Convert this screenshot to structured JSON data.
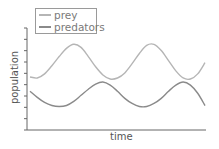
{
  "chart_data": {
    "type": "line",
    "title": "",
    "xlabel": "time",
    "ylabel": "population",
    "x_ticks": [],
    "y_ticks_count": 10,
    "y_tick_labels": [],
    "grid": false,
    "legend_position": "upper-left",
    "x": [
      0,
      1,
      2,
      3,
      4,
      5,
      6,
      7,
      8,
      9,
      10,
      11,
      12,
      13,
      14,
      15,
      16,
      17,
      18,
      19,
      20,
      21,
      22,
      23,
      24
    ],
    "series": [
      {
        "name": "prey",
        "color": "#b5b5b5",
        "values": [
          52,
          51,
          55,
          63,
          72,
          80,
          84,
          81,
          72,
          62,
          54,
          50,
          51,
          56,
          65,
          75,
          83,
          84,
          78,
          68,
          58,
          51,
          50,
          55,
          66
        ]
      },
      {
        "name": "predators",
        "color": "#8a8a8a",
        "values": [
          38,
          32,
          27,
          24,
          23,
          24,
          28,
          34,
          40,
          45,
          47,
          44,
          38,
          31,
          26,
          23,
          23,
          26,
          31,
          38,
          44,
          47,
          44,
          36,
          24
        ]
      }
    ],
    "ylim": [
      0,
      100
    ]
  },
  "legend": {
    "items": [
      {
        "label": "prey",
        "color": "#b5b5b5"
      },
      {
        "label": "predators",
        "color": "#8a8a8a"
      }
    ]
  },
  "axes": {
    "xlabel": "time",
    "ylabel": "population",
    "axis_color": "#666666"
  }
}
